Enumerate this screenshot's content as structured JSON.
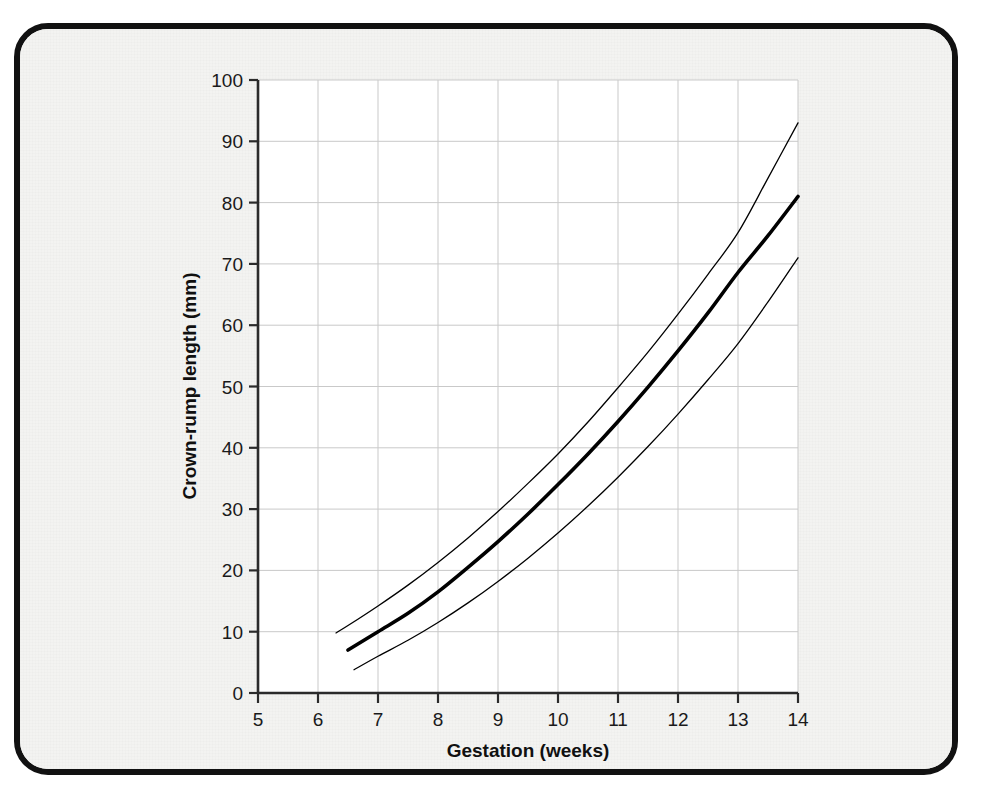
{
  "figure": {
    "frame_color": "#111111",
    "paper_color": "#f3f3f1",
    "plot_background": "#ffffff"
  },
  "chart_data": {
    "type": "line",
    "title": "",
    "subtitle": "",
    "xlabel": "Gestation (weeks)",
    "ylabel": "Crown-rump length (mm)",
    "xlim": [
      5,
      14
    ],
    "ylim": [
      0,
      100
    ],
    "xticks": [
      5,
      6,
      7,
      8,
      9,
      10,
      11,
      12,
      13,
      14
    ],
    "xtick_labels": [
      "5",
      "6",
      "7",
      "8",
      "9",
      "10",
      "11",
      "12",
      "13",
      "14"
    ],
    "yticks": [
      0,
      10,
      20,
      30,
      40,
      50,
      60,
      70,
      80,
      90,
      100
    ],
    "ytick_labels": [
      "0",
      "10",
      "20",
      "30",
      "40",
      "50",
      "60",
      "70",
      "80",
      "90",
      "100"
    ],
    "grid": true,
    "grid_color": "#c9c9c9",
    "legend": "none",
    "line_color": "#000000",
    "series": [
      {
        "name": "Upper reference limit",
        "style": "thin",
        "width": 1.3,
        "x": [
          6.3,
          6.5,
          7.0,
          7.5,
          8.0,
          8.5,
          9.0,
          9.5,
          10.0,
          10.5,
          11.0,
          11.5,
          12.0,
          12.5,
          13.0,
          13.5,
          14.0
        ],
        "y": [
          9.8,
          11.0,
          14.2,
          17.6,
          21.3,
          25.3,
          29.6,
          34.2,
          39.0,
          44.2,
          49.8,
          55.6,
          61.8,
          68.3,
          75.1,
          84.0,
          93.0
        ]
      },
      {
        "name": "Median (50th centile)",
        "style": "bold",
        "width": 3.6,
        "x": [
          6.5,
          7.0,
          7.5,
          8.0,
          8.5,
          9.0,
          9.5,
          10.0,
          10.5,
          11.0,
          11.5,
          12.0,
          12.5,
          13.0,
          13.5,
          14.0
        ],
        "y": [
          7.0,
          10.0,
          13.0,
          16.5,
          20.5,
          24.7,
          29.2,
          34.0,
          39.0,
          44.3,
          49.9,
          55.8,
          62.0,
          68.6,
          74.6,
          81.0
        ]
      },
      {
        "name": "Lower reference limit",
        "style": "thin",
        "width": 1.3,
        "x": [
          6.6,
          7.0,
          7.5,
          8.0,
          8.5,
          9.0,
          9.5,
          10.0,
          10.5,
          11.0,
          11.5,
          12.0,
          12.5,
          13.0,
          13.5,
          14.0
        ],
        "y": [
          3.8,
          6.0,
          8.6,
          11.5,
          14.7,
          18.2,
          22.0,
          26.1,
          30.5,
          35.2,
          40.2,
          45.5,
          51.1,
          57.0,
          63.8,
          71.0
        ]
      }
    ]
  }
}
